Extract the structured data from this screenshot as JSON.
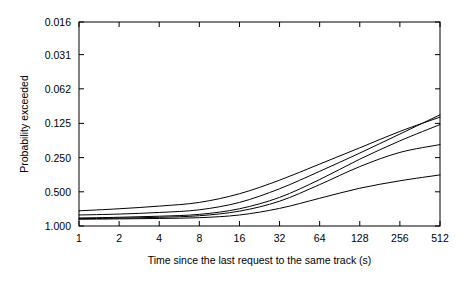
{
  "chart_data": {
    "type": "line",
    "title": "",
    "xlabel": "Time since the last request to the same track (s)",
    "ylabel": "Probability exceeded",
    "xscale": "log2",
    "yscale": "log2-reversed",
    "xlim": [
      1,
      512
    ],
    "ylim": [
      1.0,
      0.016
    ],
    "grid": false,
    "legend": null,
    "xticks": [
      1,
      2,
      4,
      8,
      16,
      32,
      64,
      128,
      256,
      512
    ],
    "xtick_labels": [
      "1",
      "2",
      "4",
      "8",
      "16",
      "32",
      "64",
      "128",
      "256",
      "512"
    ],
    "yticks": [
      0.016,
      0.031,
      0.062,
      0.125,
      0.25,
      0.5,
      1.0
    ],
    "ytick_labels": [
      "0.016",
      "0.031",
      "0.062",
      "0.125",
      "0.250",
      "0.500",
      "1.000"
    ],
    "x": [
      1,
      2,
      4,
      8,
      16,
      32,
      64,
      128,
      256,
      512
    ],
    "series": [
      {
        "name": "curve-1",
        "values": [
          0.735,
          0.705,
          0.668,
          0.62,
          0.52,
          0.395,
          0.285,
          0.205,
          0.147,
          0.11
        ]
      },
      {
        "name": "curve-2",
        "values": [
          0.8,
          0.785,
          0.76,
          0.72,
          0.62,
          0.47,
          0.33,
          0.228,
          0.155,
          0.105
        ]
      },
      {
        "name": "curve-3",
        "values": [
          0.85,
          0.838,
          0.82,
          0.79,
          0.705,
          0.56,
          0.39,
          0.258,
          0.178,
          0.128
        ]
      },
      {
        "name": "curve-4",
        "values": [
          0.862,
          0.852,
          0.838,
          0.812,
          0.74,
          0.605,
          0.432,
          0.3,
          0.225,
          0.192
        ]
      },
      {
        "name": "curve-5",
        "values": [
          0.872,
          0.866,
          0.858,
          0.845,
          0.8,
          0.7,
          0.57,
          0.465,
          0.4,
          0.355
        ]
      }
    ],
    "line_color": "#000000",
    "line_width": 1,
    "axis_color": "#000000",
    "background": "#ffffff"
  }
}
